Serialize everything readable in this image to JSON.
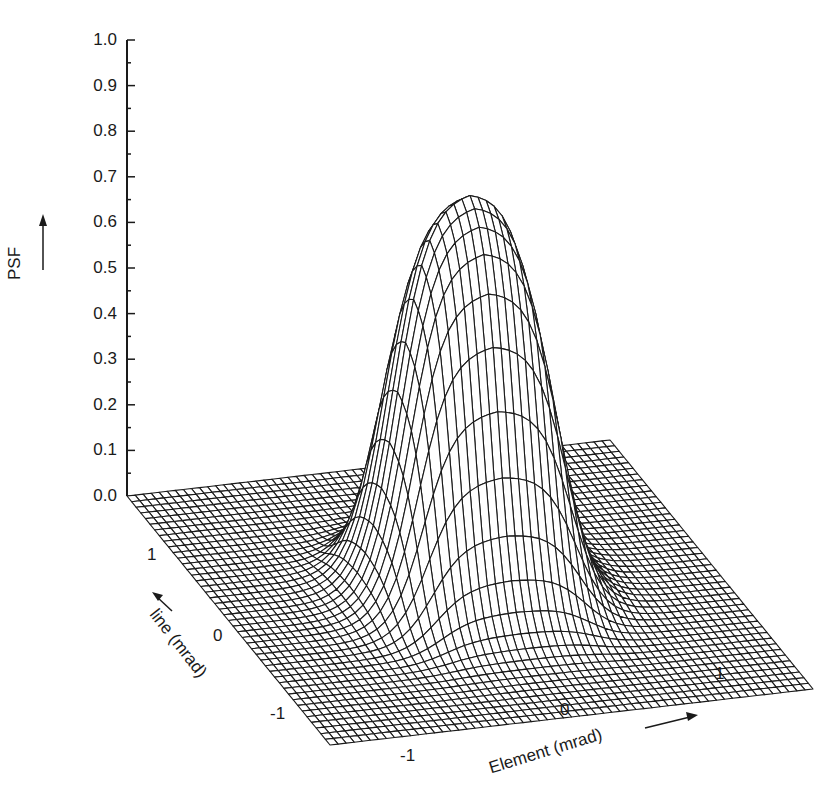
{
  "chart_data": {
    "type": "surface-wireframe",
    "title": "",
    "zlabel": "PSF",
    "xlabel": "Element (mrad)",
    "ylabel": "line (mrad)",
    "z_ticks": [
      "0.0",
      "0.1",
      "0.2",
      "0.3",
      "0.4",
      "0.5",
      "0.6",
      "0.7",
      "0.8",
      "0.9",
      "1.0"
    ],
    "zlim": [
      0,
      1.0
    ],
    "x_ticks": [
      "-1",
      "0",
      "1"
    ],
    "y_ticks": [
      "-1",
      "0",
      "1"
    ],
    "xlim": [
      -1.8,
      1.8
    ],
    "ylim": [
      -1.6,
      1.6
    ],
    "peak_value": 0.9,
    "surface": {
      "description": "Flat-topped plateau point spread function, centered at origin, ~0.9 peak, wider along Element than line",
      "plateau_halfwidth_element": 0.55,
      "plateau_halfwidth_line": 0.45,
      "edge_softness_element": 0.12,
      "edge_softness_line": 0.12,
      "grid_x": 60,
      "grid_y": 44
    },
    "grid": false,
    "legend": null
  },
  "style": {
    "line_color": "#1a1a1a",
    "background": "#ffffff"
  }
}
